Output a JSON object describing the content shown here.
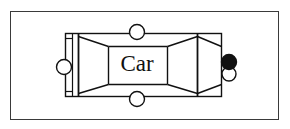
{
  "canvas": {
    "width": 290,
    "height": 129,
    "background_color": "#ffffff"
  },
  "frame": {
    "name": "outer-border",
    "x": 10,
    "y": 11,
    "width": 269,
    "height": 109,
    "stroke_color": "#3a3a3a",
    "stroke_width": 1,
    "fill": "none"
  },
  "diagram": {
    "stroke_color": "#111111",
    "fill_color": "#ffffff",
    "body": {
      "name": "car-body-rectangle",
      "x": 65,
      "y": 33,
      "width": 157,
      "height": 64
    },
    "bumper": {
      "name": "front-bumper-strip",
      "x": 65,
      "y": 33,
      "width": 13,
      "height": 64
    },
    "segments": [
      {
        "name": "front-taper",
        "x1": 78,
        "x2": 108
      },
      {
        "name": "cabin",
        "x1": 108,
        "x2": 167
      },
      {
        "name": "rear-taper",
        "x1": 167,
        "x2": 197
      },
      {
        "name": "rear-section",
        "x1": 197,
        "x2": 222
      }
    ],
    "label": {
      "text": "Car",
      "x": 137,
      "y": 65,
      "font_size": 23,
      "color": "#111111"
    }
  },
  "handles": {
    "description": "selection handles around the object",
    "radius": 7.5,
    "stroke_color": "#111111",
    "items": [
      {
        "name": "handle-top-middle",
        "cx": 137,
        "cy": 32,
        "fill": "#ffffff",
        "state": "unselected"
      },
      {
        "name": "handle-bottom-middle",
        "cx": 137,
        "cy": 99,
        "fill": "#ffffff",
        "state": "unselected"
      },
      {
        "name": "handle-left-middle",
        "cx": 64,
        "cy": 67,
        "fill": "#ffffff",
        "state": "unselected"
      },
      {
        "name": "handle-right-lower",
        "cx": 229,
        "cy": 74,
        "fill": "#ffffff",
        "state": "unselected"
      },
      {
        "name": "handle-right-active",
        "cx": 229,
        "cy": 62,
        "fill": "#111111",
        "state": "selected"
      }
    ]
  }
}
